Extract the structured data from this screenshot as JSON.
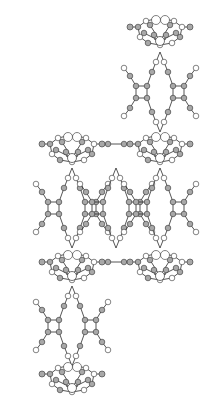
{
  "diagram": {
    "type": "crystal-structure-ball-and-stick",
    "background": "#ffffff",
    "colors": {
      "carbon": "#a8a8a8",
      "nitrogen_hydrogen": "#ffffff",
      "bond": "#2a2a2a"
    },
    "metal_complexes": [
      {
        "id": "complex-top-right",
        "cx": 160,
        "cy": 33
      },
      {
        "id": "complex-mid-left",
        "cx": 72,
        "cy": 150
      },
      {
        "id": "complex-mid-right",
        "cx": 160,
        "cy": 150
      },
      {
        "id": "complex-lower-left",
        "cx": 72,
        "cy": 268
      },
      {
        "id": "complex-lower-right",
        "cx": 160,
        "cy": 268
      },
      {
        "id": "complex-bottom-left",
        "cx": 72,
        "cy": 380
      }
    ],
    "bridging_ligands": [
      {
        "id": "ligand-top-right",
        "cx": 160,
        "cy": 92
      },
      {
        "id": "ligand-mid-left",
        "cx": 72,
        "cy": 208
      },
      {
        "id": "ligand-mid-center",
        "cx": 116,
        "cy": 208
      },
      {
        "id": "ligand-mid-right",
        "cx": 160,
        "cy": 208
      },
      {
        "id": "ligand-bottom-left",
        "cx": 72,
        "cy": 326
      }
    ]
  }
}
